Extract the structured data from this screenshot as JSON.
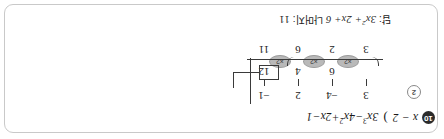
{
  "page": {
    "border_color": "#c9c9c9",
    "background": "#ffffff",
    "orientation_note": "content rendered rotated 180 degrees"
  },
  "problem": {
    "number_badge": "10",
    "secondary_badge": "2",
    "open_paren": ")",
    "divisor": "x − 2",
    "dividend_text": "3x³ − 4x² + 2x − 1",
    "dividend_parts": {
      "t1_coef": "3",
      "t1_var": "x",
      "t1_exp": "3",
      "t2": "−4",
      "t2_var": "x",
      "t2_exp": "2",
      "t3": "+2",
      "t3_var": "x",
      "t4": "−1"
    }
  },
  "synthetic_division": {
    "coefficients": [
      "3",
      "−4",
      "2",
      "−1"
    ],
    "products": [
      "",
      "6",
      "4",
      "12"
    ],
    "sums": [
      "3",
      "2",
      "6",
      "11"
    ],
    "multiplier_label": "×2",
    "multiplier_count": 3,
    "quotient_cells": [
      "3",
      "2",
      "6"
    ],
    "remainder_cell": "11"
  },
  "answer": {
    "label": "답:",
    "quotient_text": "3x² + 2x + 6",
    "quotient_parts": {
      "c1": "3",
      "v1": "x",
      "e1": "2",
      "c2": "+ 2",
      "v2": "x",
      "c3": "+ 6"
    },
    "remainder_label": "나머지:",
    "remainder_value": "11"
  }
}
